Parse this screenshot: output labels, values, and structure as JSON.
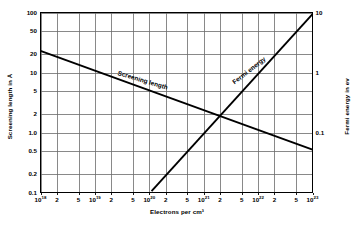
{
  "chart_data": {
    "type": "line",
    "title": "",
    "xlabel": "Electrons per cm³",
    "ylabel_left": "Screening length in Å",
    "ylabel_right": "Fermi energy in ev",
    "xscale": "log",
    "yscale": "log",
    "xlim": [
      1e+18,
      1e+23
    ],
    "ylim_left": [
      0.1,
      100
    ],
    "ylim_right": [
      0.01,
      10
    ],
    "grid": true,
    "legend": "inline-curve-labels",
    "x_major_ticks": [
      "10^18",
      "10^19",
      "10^20",
      "10^21",
      "10^22",
      "10^23"
    ],
    "x_tick_labels": [
      {
        "value": 1e+18,
        "text": "10",
        "exp": "18"
      },
      {
        "value": 2e+18,
        "text": "2",
        "exp": ""
      },
      {
        "value": 5e+18,
        "text": "5",
        "exp": ""
      },
      {
        "value": 1e+19,
        "text": "10",
        "exp": "19"
      },
      {
        "value": 2e+19,
        "text": "2",
        "exp": ""
      },
      {
        "value": 5e+19,
        "text": "5",
        "exp": ""
      },
      {
        "value": 1e+20,
        "text": "10",
        "exp": "20"
      },
      {
        "value": 2e+20,
        "text": "2",
        "exp": ""
      },
      {
        "value": 5e+20,
        "text": "5",
        "exp": ""
      },
      {
        "value": 1e+21,
        "text": "10",
        "exp": "21"
      },
      {
        "value": 2e+21,
        "text": "2",
        "exp": ""
      },
      {
        "value": 5e+21,
        "text": "5",
        "exp": ""
      },
      {
        "value": 1e+22,
        "text": "10",
        "exp": "22"
      },
      {
        "value": 2e+22,
        "text": "2",
        "exp": ""
      },
      {
        "value": 5e+22,
        "text": "5",
        "exp": ""
      },
      {
        "value": 1e+23,
        "text": "10",
        "exp": "23"
      }
    ],
    "y_left_tick_labels": [
      {
        "value": 100,
        "text": "100"
      },
      {
        "value": 50,
        "text": "50"
      },
      {
        "value": 20,
        "text": "20"
      },
      {
        "value": 10,
        "text": "10"
      },
      {
        "value": 5,
        "text": "5"
      },
      {
        "value": 2,
        "text": "2"
      },
      {
        "value": 1,
        "text": "1.0"
      },
      {
        "value": 0.5,
        "text": "0.5"
      },
      {
        "value": 0.2,
        "text": "0.2"
      },
      {
        "value": 0.1,
        "text": "0.1"
      }
    ],
    "y_right_tick_labels": [
      {
        "value": 10,
        "text": "10"
      },
      {
        "value": 1,
        "text": "1"
      },
      {
        "value": 0.1,
        "text": "0.1"
      }
    ],
    "series": [
      {
        "name": "Screening length",
        "axis": "left",
        "label_text": "Screening length",
        "points": [
          {
            "x": 1e+18,
            "y": 23
          },
          {
            "x": 1e+23,
            "y": 0.52
          }
        ]
      },
      {
        "name": "Fermi energy",
        "axis": "right",
        "label_text": "Fermi energy",
        "points": [
          {
            "x": 1.1e+20,
            "y": 0.0105
          },
          {
            "x": 1e+23,
            "y": 9.4
          }
        ]
      }
    ],
    "colors": {
      "curve": "#000000",
      "grid": "#6b6b6b",
      "axis": "#000000",
      "background": "#ffffff"
    }
  }
}
